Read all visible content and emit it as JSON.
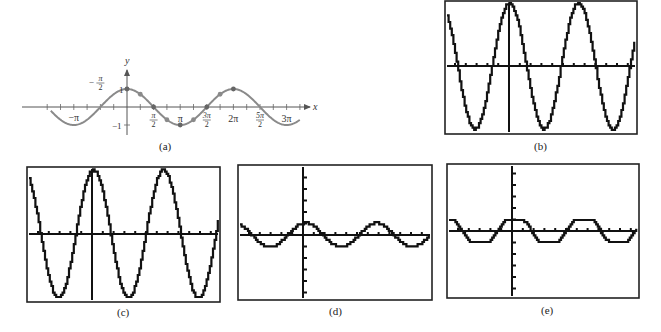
{
  "figure": {
    "panels": [
      {
        "id": "a",
        "label": "(a)",
        "kind": "textbook-plot",
        "function": "y = cos x",
        "axis_labels": {
          "x": "x",
          "y": "y"
        },
        "y_tick_labels": [
          "1",
          "−1"
        ],
        "x_tick_labels": [
          {
            "text": "−π",
            "value": -3.14159
          },
          {
            "text": "−π/2",
            "value": -1.5708
          },
          {
            "text": "π/2",
            "value": 1.5708
          },
          {
            "text": "π",
            "value": 3.14159
          },
          {
            "text": "3π/2",
            "value": 4.7124
          },
          {
            "text": "2π",
            "value": 6.28318
          },
          {
            "text": "5π/2",
            "value": 7.854
          },
          {
            "text": "3π",
            "value": 9.4248
          }
        ],
        "highlighted_points": [
          [
            0,
            1
          ],
          [
            0.7854,
            0.7071
          ],
          [
            1.5708,
            0
          ],
          [
            2.3562,
            -0.7071
          ],
          [
            3.14159,
            -1
          ],
          [
            3.927,
            -0.7071
          ],
          [
            4.7124,
            0
          ],
          [
            5.4978,
            0.7071
          ],
          [
            6.28318,
            1
          ]
        ],
        "x_range": [
          -4.5,
          10.2
        ],
        "curve_color": "#8a8a8a",
        "axis_color": "#555555"
      },
      {
        "id": "b",
        "label": "(b)",
        "kind": "calculator-screen",
        "amplitude_px": 63,
        "period_px": 69,
        "phase_peak_x": 509,
        "flat_top": false
      },
      {
        "id": "c",
        "label": "(c)",
        "kind": "calculator-screen",
        "amplitude_px": 64,
        "period_px": 70,
        "phase_peak_x": 93,
        "flat_top": false
      },
      {
        "id": "d",
        "label": "(d)",
        "kind": "calculator-screen",
        "amplitude_px": 12,
        "period_px": 71,
        "phase_peak_x": 305,
        "flat_top": false
      },
      {
        "id": "e",
        "label": "(e)",
        "kind": "calculator-screen",
        "amplitude_px": 12,
        "period_px": 69,
        "phase_peak_x": 514,
        "flat_top": true
      }
    ]
  }
}
